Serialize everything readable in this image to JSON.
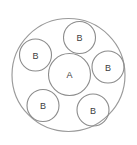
{
  "diagram": {
    "canvas": {
      "width": 137,
      "height": 145
    },
    "style": {
      "background_color": "#ffffff",
      "stroke_color": "#8c8c8c",
      "outer_stroke_color": "#9a9a9a",
      "label_color": "#3d3d3d",
      "stroke_width": 1.1
    },
    "outer_circle": {
      "name": "outer-boundary-circle",
      "label": "",
      "cx": 68.5,
      "cy": 75,
      "r": 56.5
    },
    "inner_circles": [
      {
        "id": "center-a",
        "label": "A",
        "cx": 69.5,
        "cy": 74.5,
        "r": 21.0
      },
      {
        "id": "satellite-top",
        "label": "B",
        "cx": 79.5,
        "cy": 37.5,
        "r": 16.0
      },
      {
        "id": "satellite-left",
        "label": "B",
        "cx": 35.5,
        "cy": 55.0,
        "r": 16.0
      },
      {
        "id": "satellite-right",
        "label": "B",
        "cx": 108.0,
        "cy": 67.0,
        "r": 16.0
      },
      {
        "id": "satellite-bottom-left",
        "label": "B",
        "cx": 43.0,
        "cy": 105.5,
        "r": 16.0
      },
      {
        "id": "satellite-bottom-right",
        "label": "B",
        "cx": 93.0,
        "cy": 110.0,
        "r": 16.0
      }
    ]
  }
}
